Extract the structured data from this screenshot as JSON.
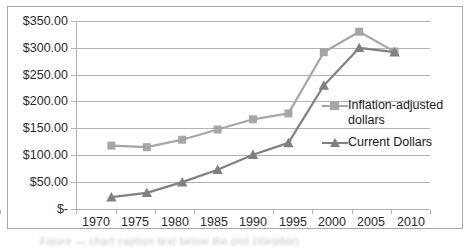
{
  "chart_data": {
    "type": "line",
    "title": "",
    "subtitle": "",
    "xlabel": "",
    "ylabel": "",
    "categories": [
      "1970",
      "1975",
      "1980",
      "1985",
      "1990",
      "1995",
      "2000",
      "2005",
      "2010"
    ],
    "x": [
      1970,
      1975,
      1980,
      1985,
      1990,
      1995,
      2000,
      2005,
      2010
    ],
    "ylim": [
      0,
      350
    ],
    "ytick_values": [
      0,
      50,
      100,
      150,
      200,
      250,
      300,
      350
    ],
    "ytick_labels": [
      "$-",
      "$50.00",
      "$100.00",
      "$150.00",
      "$200.00",
      "$250.00",
      "$300.00",
      "$350.00"
    ],
    "grid": true,
    "legend_position": "inside-right",
    "series": [
      {
        "name": "Inflation-adjusted dollars",
        "marker": "square",
        "color": "#a6a6a6",
        "values": [
          118,
          115,
          129,
          148,
          167,
          178,
          292,
          330,
          293
        ]
      },
      {
        "name": "Current Dollars",
        "marker": "triangle",
        "color": "#808080",
        "values": [
          22,
          30,
          50,
          73,
          101,
          123,
          230,
          300,
          292
        ]
      }
    ]
  },
  "legend": {
    "items": [
      {
        "label": "Inflation-adjusted\ndollars",
        "marker": "square-marker-icon",
        "color": "#a6a6a6"
      },
      {
        "label": "Current Dollars",
        "marker": "triangle-marker-icon",
        "color": "#808080"
      }
    ]
  },
  "colors": {
    "inflation_adjusted": "#a6a6a6",
    "current_dollars": "#808080",
    "gridline": "#b3b3b3",
    "frame_border": "#a9a9a9",
    "axis_text": "#2b2b2b",
    "background": "#ffffff"
  },
  "caption": {
    "smudged_text": "Figure — chart caption text below the plot (illegible)"
  }
}
